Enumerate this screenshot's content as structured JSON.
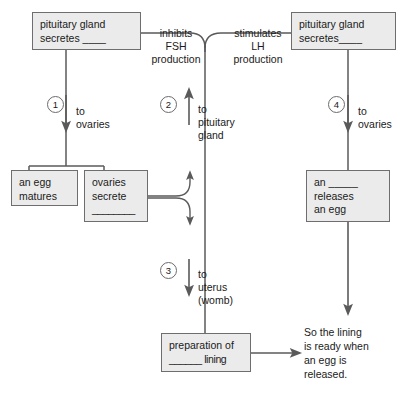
{
  "diagram": {
    "palette": {
      "box_fill": "#ebebeb",
      "box_border": "#6e6e6e",
      "line": "#595959",
      "text": "#1a1a1a",
      "background": "#ffffff"
    },
    "boxes": [
      {
        "id": "pituitary-fsh",
        "name": "box-pituitary-gland-secretes-left",
        "lines": [
          "pituitary gland",
          "secretes ____"
        ]
      },
      {
        "id": "pituitary-lh",
        "name": "box-pituitary-gland-secretes-right",
        "lines": [
          "pituitary gland",
          "secretes____"
        ]
      },
      {
        "id": "egg-matures",
        "name": "box-an-egg-matures",
        "lines": [
          "an egg",
          "matures"
        ]
      },
      {
        "id": "ovaries-secrete",
        "name": "box-ovaries-secrete",
        "lines": [
          "ovaries",
          "secrete",
          "________"
        ]
      },
      {
        "id": "releases-egg",
        "name": "box-an-releases-an-egg",
        "lines": [
          "an _____",
          "releases",
          "an egg"
        ]
      },
      {
        "id": "preparation-lining",
        "name": "box-preparation-of-lining",
        "lines": [
          "preparation of",
          "______ lining"
        ]
      }
    ],
    "feedback_labels": [
      {
        "id": "inhibits-fsh",
        "lines": [
          "inhibits",
          "FSH",
          "production"
        ]
      },
      {
        "id": "stimulates-lh",
        "lines": [
          "stimulates",
          "LH",
          "production"
        ]
      }
    ],
    "arrow_labels": [
      {
        "id": "to-ovaries-1",
        "lines": [
          "to",
          "ovaries"
        ]
      },
      {
        "id": "to-pituitary-gland-2",
        "lines": [
          "to",
          "pituitary",
          "gland"
        ]
      },
      {
        "id": "to-uterus-3",
        "lines": [
          "to",
          "uterus",
          "(womb)"
        ]
      },
      {
        "id": "to-ovaries-4",
        "lines": [
          "to",
          "ovaries"
        ]
      }
    ],
    "step_numbers": [
      {
        "id": "step-1",
        "value": "1"
      },
      {
        "id": "step-2",
        "value": "2"
      },
      {
        "id": "step-3",
        "value": "3"
      },
      {
        "id": "step-4",
        "value": "4"
      }
    ],
    "conclusion": {
      "id": "conclusion-text",
      "text": "So the lining\nis ready when\nan egg is\nreleased."
    }
  }
}
